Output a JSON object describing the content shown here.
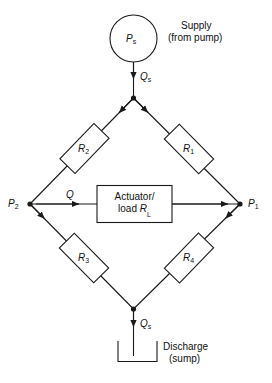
{
  "diagram": {
    "type": "schematic",
    "source_node": {
      "symbol": "P",
      "subscript": "s",
      "shape": "circle"
    },
    "supply_annotation": {
      "line1": "Supply",
      "line2": "(from pump)"
    },
    "discharge_annotation": {
      "line1": "Discharge",
      "line2": "(sump)"
    },
    "flows": {
      "supply_top": {
        "symbol": "Q",
        "subscript": "s"
      },
      "discharge_bottom": {
        "symbol": "Q",
        "subscript": "s"
      },
      "load_branch": {
        "symbol": "Q",
        "subscript": ""
      }
    },
    "nodes": {
      "left": {
        "symbol": "P",
        "subscript": "2"
      },
      "right": {
        "symbol": "P",
        "subscript": "1"
      }
    },
    "resistors": [
      {
        "symbol": "R",
        "subscript": "1",
        "position": "upper-right"
      },
      {
        "symbol": "R",
        "subscript": "2",
        "position": "upper-left"
      },
      {
        "symbol": "R",
        "subscript": "3",
        "position": "lower-left"
      },
      {
        "symbol": "R",
        "subscript": "4",
        "position": "lower-right"
      }
    ],
    "load_block": {
      "line1": "Actuator/",
      "line2_prefix": "load ",
      "line2_symbol": "R",
      "line2_subscript": "L"
    },
    "colors": {
      "stroke": "#1a1a1a",
      "background": "#ffffff",
      "text": "#111111"
    }
  }
}
